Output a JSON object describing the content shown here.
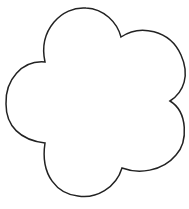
{
  "shape": {
    "name": "flower-outline",
    "petals": 5,
    "stroke_color": "#222222",
    "fill_color": "#ffffff"
  }
}
